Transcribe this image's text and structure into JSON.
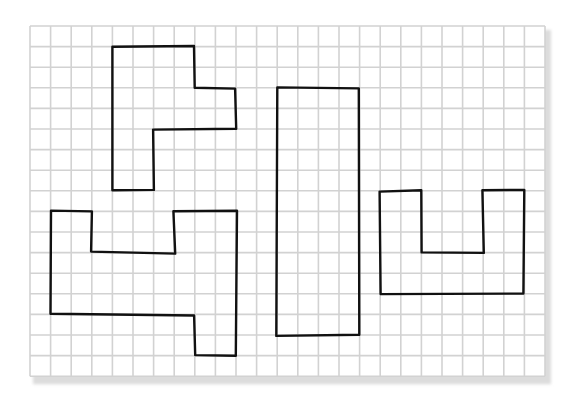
{
  "figure": {
    "background_color": "#ffffff",
    "paper_color": "#ffffff",
    "shadow_color": "#dcdcdc",
    "grid_line_color": "#d2d2d2",
    "outline_color": "#111111",
    "outline_width": 2.4
  },
  "grid": {
    "origin_x": 30,
    "origin_y": 26,
    "cell_size": 20.6,
    "columns": 25,
    "rows": 17
  },
  "shapes": [
    {
      "id": "shape-top-left",
      "name": "L-shaped hexomino-style polygon with side tab",
      "points": [
        [
          4,
          1
        ],
        [
          8,
          1
        ],
        [
          8,
          3
        ],
        [
          10,
          3
        ],
        [
          10,
          5
        ],
        [
          6,
          5
        ],
        [
          6,
          8
        ],
        [
          4,
          8
        ]
      ]
    },
    {
      "id": "shape-bottom-left",
      "name": "Polygon with notch on top and tab on bottom right",
      "points": [
        [
          1,
          9
        ],
        [
          3,
          9
        ],
        [
          3,
          11
        ],
        [
          7,
          11
        ],
        [
          7,
          9
        ],
        [
          10,
          9
        ],
        [
          10,
          16
        ],
        [
          8,
          16
        ],
        [
          8,
          14
        ],
        [
          1,
          14
        ]
      ]
    },
    {
      "id": "shape-tall-rectangle",
      "name": "Tall rectangle 4 by 12 cells",
      "points": [
        [
          12,
          3
        ],
        [
          16,
          3
        ],
        [
          16,
          15
        ],
        [
          12,
          15
        ]
      ]
    },
    {
      "id": "shape-u-right",
      "name": "U-shaped polygon",
      "points": [
        [
          17,
          8
        ],
        [
          19,
          8
        ],
        [
          19,
          11
        ],
        [
          22,
          11
        ],
        [
          22,
          8
        ],
        [
          24,
          8
        ],
        [
          24,
          13
        ],
        [
          17,
          13
        ]
      ]
    }
  ]
}
